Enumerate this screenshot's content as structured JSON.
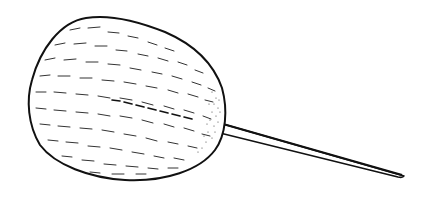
{
  "image": {
    "subject": "Line drawing of a fuzzy ball (swab / mop head) on a thin stick",
    "colors": {
      "background": "#ffffff",
      "ink": "#111111"
    }
  }
}
